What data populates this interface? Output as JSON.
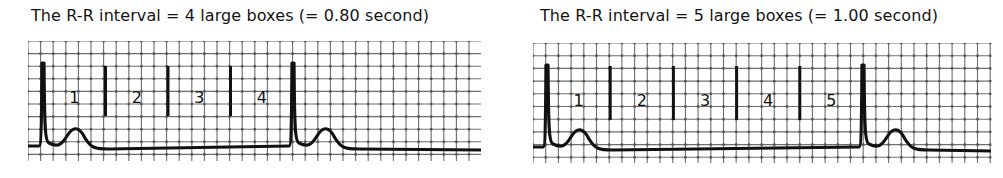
{
  "colors": {
    "grid": "#555555",
    "trace": "#111111",
    "marker": "#111111",
    "background": "#ffffff"
  },
  "panels": [
    {
      "title": "The R-R interval = 4 large boxes (= 0.80 second)",
      "large_boxes": 4,
      "seconds": "0.80",
      "box_labels": [
        "1",
        "2",
        "3",
        "4"
      ]
    },
    {
      "title": "The R-R interval = 5 large boxes (= 1.00 second)",
      "large_boxes": 5,
      "seconds": "1.00",
      "box_labels": [
        "1",
        "2",
        "3",
        "4",
        "5"
      ]
    }
  ]
}
